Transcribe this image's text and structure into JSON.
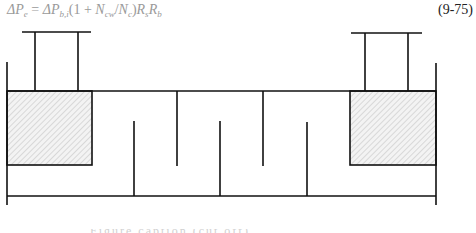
{
  "equation": {
    "lhs_symbol": "ΔP",
    "lhs_sub": "e",
    "equals": " = ",
    "rhs_symbol": "ΔP",
    "rhs_sub": "b,i",
    "open_paren": "(1 + ",
    "n1": "N",
    "n1_sub": "cw",
    "slash": "/",
    "n2": "N",
    "n2_sub": "c",
    "close_paren": ")",
    "r1": "R",
    "r1_sub": "s",
    "r2": "R",
    "r2_sub": "b",
    "number": "(9-75)",
    "color": "#9a9a9a"
  },
  "diagram": {
    "line_color": "#111111",
    "hatch_color": "#bdbdbd",
    "end_zone_fill": "#f3f3f3",
    "nozzles": [
      "left-nozzle",
      "right-nozzle"
    ],
    "end_zones": [
      "left-end-zone",
      "right-end-zone"
    ],
    "baffles_top_hanging": 2,
    "baffles_bottom_rising": 3
  },
  "caption": {
    "text": "Figure caption (cut off)"
  }
}
